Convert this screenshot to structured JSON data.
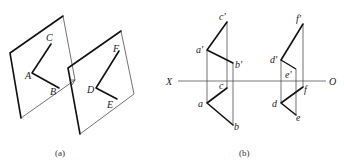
{
  "figure_a": {
    "caption": "(a)",
    "plane1": {
      "labels": {
        "A": "A",
        "B": "B",
        "C": "C"
      }
    },
    "plane2": {
      "labels": {
        "D": "D",
        "E": "E",
        "F": "F"
      }
    }
  },
  "figure_b": {
    "caption": "(b)",
    "axis": {
      "left": "X",
      "right": "O"
    },
    "labels": {
      "a_prime": "a'",
      "b_prime": "b'",
      "c_prime": "c'",
      "a": "a",
      "b": "b",
      "c": "c",
      "d_prime": "d'",
      "e_prime": "e'",
      "f_prime": "f'",
      "d": "d",
      "e": "e",
      "f": "f"
    }
  }
}
